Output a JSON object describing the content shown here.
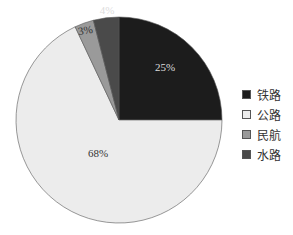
{
  "chart_data": {
    "type": "pie",
    "title": "",
    "start_angle_deg": 0,
    "direction": "clockwise",
    "categories": [
      "铁路",
      "公路",
      "民航",
      "水路"
    ],
    "values": [
      25,
      68,
      3,
      4
    ],
    "labels": [
      "25%",
      "68%",
      "3%",
      "4%"
    ],
    "colors": [
      "#1c1c1c",
      "#ececec",
      "#9a9a9a",
      "#4a4a4a"
    ],
    "label_colors": [
      "#dddddd",
      "#333333",
      "#333333",
      "#dddddd"
    ],
    "legend_position": "right"
  },
  "legend": {
    "items": [
      {
        "label": "铁路",
        "color": "#1c1c1c"
      },
      {
        "label": "公路",
        "color": "#ececec"
      },
      {
        "label": "民航",
        "color": "#9a9a9a"
      },
      {
        "label": "水路",
        "color": "#4a4a4a"
      }
    ]
  }
}
